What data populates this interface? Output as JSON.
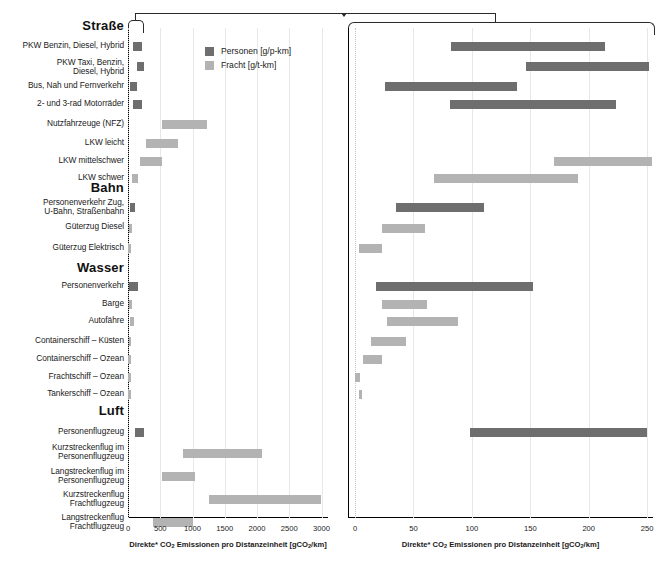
{
  "chart_data": {
    "type": "bar",
    "title": "",
    "orientation": "horizontal-range",
    "xlabel": "Direkte* CO2 Emissionen pro Distanzeinheit [gCO2/km]",
    "legend": {
      "position": "top-left-panel",
      "entries": [
        {
          "name": "Personen [g/p-km]",
          "color": "#6e6e6e",
          "key": "personen"
        },
        {
          "name": "Fracht [g/t-km]",
          "color": "#b3b3b3",
          "key": "fracht"
        }
      ]
    },
    "panels": [
      {
        "id": "left",
        "xlim": [
          0,
          3100
        ],
        "ticks": [
          0,
          500,
          1000,
          1500,
          2000,
          2500,
          3000
        ],
        "tick_labels": [
          "0",
          "500",
          "1000",
          "1500",
          "2000",
          "2500",
          "3000"
        ],
        "axis_caption": "Direkte* CO2 Emissionen pro Distanzeinheit [gCO2/km]"
      },
      {
        "id": "right",
        "xlim": [
          -6,
          255
        ],
        "ticks": [
          0,
          50,
          100,
          150,
          200,
          250
        ],
        "tick_labels": [
          "0",
          "50",
          "100",
          "150",
          "200",
          "250"
        ],
        "axis_caption": "Direkte* CO2 Emissionen pro Distanzeinheit [gCO2/km]"
      }
    ],
    "groups": [
      {
        "name": "Straße",
        "rows": [
          {
            "label": "PKW Benzin, Diesel, Hybrid",
            "series": "personen",
            "left": [
              80,
              215
            ],
            "right": [
              82,
              214
            ]
          },
          {
            "label": "PKW Taxi, Benzin,\nDiesel, Hybrid",
            "series": "personen",
            "left": [
              145,
              253
            ],
            "right": [
              146,
              252
            ]
          },
          {
            "label": "Bus, Nah und Fernverkehr",
            "series": "personen",
            "left": [
              26,
              140
            ],
            "right": [
              26,
              139
            ]
          },
          {
            "label": "2- und 3-rad Motorräder",
            "series": "personen",
            "left": [
              80,
              222
            ],
            "right": [
              81,
              223
            ]
          },
          {
            "label": "Nutzfahrzeuge (NFZ)",
            "series": "fracht",
            "left": [
              530,
              1220
            ],
            "right": null
          },
          {
            "label": "LKW leicht",
            "series": "fracht",
            "left": [
              280,
              780
            ],
            "right": null
          },
          {
            "label": "LKW mittelschwer",
            "series": "fracht",
            "left": [
              185,
              530
            ],
            "right": [
              170,
              254
            ]
          },
          {
            "label": "LKW schwer",
            "series": "fracht",
            "left": [
              65,
              155
            ],
            "right": [
              68,
              191
            ]
          }
        ]
      },
      {
        "name": "Bahn",
        "rows": [
          {
            "label": "Personenverkehr Zug,\nU-Bahn, Straßenbahn",
            "series": "personen",
            "left": [
              33,
              112
            ],
            "right": [
              35,
              110
            ]
          },
          {
            "label": "Güterzug Diesel",
            "series": "fracht",
            "left": [
              22,
              60
            ],
            "right": [
              23,
              60
            ]
          },
          {
            "label": "Güterzug Elektrisch",
            "series": "fracht",
            "left": [
              3,
              23
            ],
            "right": [
              3,
              23
            ]
          }
        ]
      },
      {
        "name": "Wasser",
        "rows": [
          {
            "label": "Personenverkehr",
            "series": "personen",
            "left": [
              18,
              152
            ],
            "right": [
              18,
              152
            ]
          },
          {
            "label": "Barge",
            "series": "fracht",
            "left": [
              23,
              62
            ],
            "right": [
              23,
              62
            ]
          },
          {
            "label": "Autofähre",
            "series": "fracht",
            "left": [
              27,
              88
            ],
            "right": [
              27,
              88
            ]
          },
          {
            "label": "Containerschiff – Küsten",
            "series": "fracht",
            "left": [
              14,
              44
            ],
            "right": [
              14,
              44
            ]
          },
          {
            "label": "Containerschiff – Ozean",
            "series": "fracht",
            "left": [
              7,
              23
            ],
            "right": [
              7,
              23
            ]
          },
          {
            "label": "Frachtschiff – Ozean",
            "series": "fracht",
            "left": [
              0,
              4
            ],
            "right": [
              0,
              4
            ]
          },
          {
            "label": "Tankerschiff – Ozean",
            "series": "fracht",
            "left": [
              3,
              6
            ],
            "right": [
              3,
              6
            ]
          }
        ]
      },
      {
        "name": "Luft",
        "rows": [
          {
            "label": "Personenflugzeug",
            "series": "personen",
            "left": [
              110,
              250
            ],
            "right": [
              98,
              250
            ]
          },
          {
            "label": "Kurzstreckenflug im\nPersonenflugzeug",
            "series": "fracht",
            "left": [
              850,
              2075
            ],
            "right": null
          },
          {
            "label": "Langstreckenflug im\nPersonenflugzeug",
            "series": "fracht",
            "left": [
              520,
              1040
            ],
            "right": null
          },
          {
            "label": "Kurzstreckenflug\nFrachtflugzeug",
            "series": "fracht",
            "left": [
              1255,
              2985
            ],
            "right": null
          },
          {
            "label": "Langstreckenflug\nFrachtflugzeug",
            "series": "fracht",
            "left": [
              395,
              1005
            ],
            "right": null
          }
        ]
      }
    ]
  },
  "colors": {
    "personen": "#6e6e6e",
    "fracht": "#b3b3b3",
    "axis": "#000000",
    "grid": "#e8e8e8",
    "zero_dotted": "#bdbdbd"
  }
}
